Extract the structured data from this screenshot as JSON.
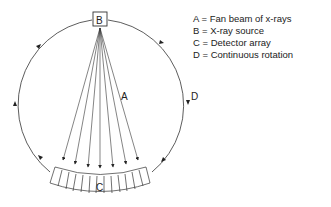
{
  "diagram": {
    "labels": {
      "A": "A",
      "B": "B",
      "C": "C",
      "D": "D"
    },
    "legend": [
      "A = Fan beam of x-rays",
      "B = X-ray source",
      "C = Detector array",
      "D = Continuous rotation"
    ]
  }
}
